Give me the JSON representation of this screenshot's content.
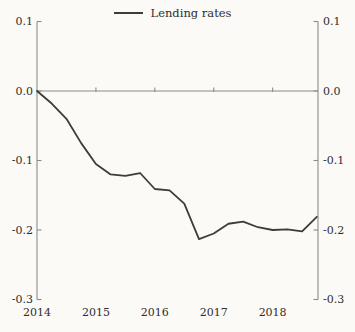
{
  "colors": {
    "background": "#fbfaf6",
    "axis": "#8b8b8b",
    "line": "#3c3c3c",
    "text": "#2e2e2e"
  },
  "chart_data": {
    "type": "line",
    "title": "",
    "legend": [
      "Lending rates"
    ],
    "legend_position": "top-center",
    "grid": false,
    "zero_baseline": true,
    "x_axis": {
      "range": [
        2014,
        2018.77
      ],
      "ticks": [
        2014,
        2015,
        2016,
        2017,
        2018
      ],
      "labels": [
        "2014",
        "2015",
        "2016",
        "2017",
        "2018"
      ]
    },
    "y_axis": {
      "range": [
        -0.3,
        0.1
      ],
      "sides": "both",
      "ticks": [
        0.1,
        0.0,
        -0.1,
        -0.2,
        -0.3
      ],
      "labels": [
        "0.1",
        "0.0",
        "-0.1",
        "-0.2",
        "-0.3"
      ]
    },
    "series": [
      {
        "name": "Lending rates",
        "x": [
          2014.0,
          2014.25,
          2014.5,
          2014.75,
          2015.0,
          2015.25,
          2015.5,
          2015.75,
          2016.0,
          2016.25,
          2016.5,
          2016.75,
          2017.0,
          2017.25,
          2017.5,
          2017.75,
          2018.0,
          2018.25,
          2018.5,
          2018.75
        ],
        "values": [
          0.0,
          -0.018,
          -0.04,
          -0.075,
          -0.105,
          -0.12,
          -0.122,
          -0.118,
          -0.141,
          -0.143,
          -0.162,
          -0.213,
          -0.205,
          -0.191,
          -0.188,
          -0.196,
          -0.2,
          -0.199,
          -0.202,
          -0.181
        ]
      }
    ]
  }
}
